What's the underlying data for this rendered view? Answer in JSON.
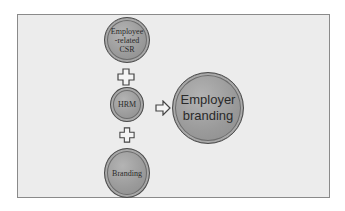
{
  "diagram": {
    "type": "flow",
    "nodes": [
      {
        "id": "csr",
        "label": "Employee -related CSR",
        "lines": [
          "Employee",
          "-related",
          "CSR"
        ]
      },
      {
        "id": "hrm",
        "label": "HRM"
      },
      {
        "id": "branding",
        "label": "Branding"
      },
      {
        "id": "employer_branding",
        "label": "Employer branding",
        "lines": [
          "Employer",
          "branding"
        ]
      }
    ],
    "connectors": [
      {
        "type": "plus",
        "between": [
          "csr",
          "hrm"
        ],
        "icon": "plus-icon"
      },
      {
        "type": "plus",
        "between": [
          "hrm",
          "branding"
        ],
        "icon": "plus-icon"
      },
      {
        "type": "arrow",
        "from": "hrm",
        "to": "employer_branding",
        "icon": "right-arrow-icon"
      }
    ]
  }
}
